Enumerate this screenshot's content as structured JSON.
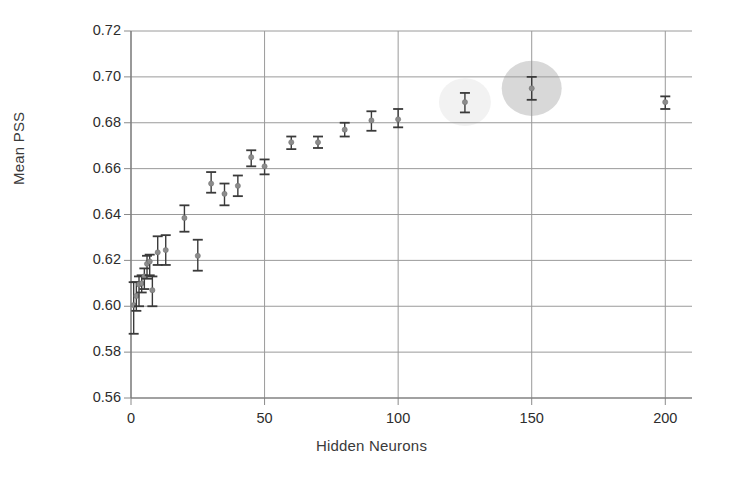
{
  "chart_data": {
    "type": "scatter",
    "title": "",
    "xlabel": "Hidden Neurons",
    "ylabel": "Mean PSS",
    "xlim": [
      0,
      210
    ],
    "ylim": [
      0.56,
      0.72
    ],
    "xticks": [
      0,
      50,
      100,
      150,
      200
    ],
    "xtick_labels": [
      "0",
      "50",
      "100",
      "150",
      "200"
    ],
    "yticks": [
      0.56,
      0.58,
      0.6,
      0.62,
      0.64,
      0.66,
      0.68,
      0.7,
      0.72
    ],
    "ytick_labels": [
      "0.56",
      "0.58",
      "0.60",
      "0.62",
      "0.64",
      "0.66",
      "0.68",
      "0.70",
      "0.72"
    ],
    "grid": true,
    "grid_axis": "both",
    "legend": false,
    "error_bars": "vertical",
    "marker": "circle",
    "marker_color": "#8c8c8c",
    "errorbar_color": "#3a3a3a",
    "series": [
      {
        "name": "Mean PSS vs Hidden Neurons",
        "points": [
          {
            "x": 1,
            "y": 0.6005,
            "err_low": 0.0125,
            "err_high": 0.01
          },
          {
            "x": 2,
            "y": 0.6045,
            "err_low": 0.0065,
            "err_high": 0.006
          },
          {
            "x": 3,
            "y": 0.6095,
            "err_low": 0.0095,
            "err_high": 0.0035
          },
          {
            "x": 4,
            "y": 0.61,
            "err_low": 0.004,
            "err_high": 0.0035
          },
          {
            "x": 5,
            "y": 0.613,
            "err_low": 0.0055,
            "err_high": 0.0035
          },
          {
            "x": 6,
            "y": 0.6185,
            "err_low": 0.0065,
            "err_high": 0.0035
          },
          {
            "x": 7,
            "y": 0.6195,
            "err_low": 0.006,
            "err_high": 0.003
          },
          {
            "x": 8,
            "y": 0.607,
            "err_low": 0.007,
            "err_high": 0.006
          },
          {
            "x": 10,
            "y": 0.6235,
            "err_low": 0.0055,
            "err_high": 0.007
          },
          {
            "x": 13,
            "y": 0.6245,
            "err_low": 0.0065,
            "err_high": 0.0065
          },
          {
            "x": 20,
            "y": 0.6385,
            "err_low": 0.006,
            "err_high": 0.0055
          },
          {
            "x": 25,
            "y": 0.622,
            "err_low": 0.0065,
            "err_high": 0.007
          },
          {
            "x": 30,
            "y": 0.6535,
            "err_low": 0.004,
            "err_high": 0.005
          },
          {
            "x": 35,
            "y": 0.649,
            "err_low": 0.005,
            "err_high": 0.0045
          },
          {
            "x": 40,
            "y": 0.6525,
            "err_low": 0.0045,
            "err_high": 0.0045
          },
          {
            "x": 45,
            "y": 0.665,
            "err_low": 0.004,
            "err_high": 0.003
          },
          {
            "x": 50,
            "y": 0.661,
            "err_low": 0.0035,
            "err_high": 0.003
          },
          {
            "x": 60,
            "y": 0.6715,
            "err_low": 0.003,
            "err_high": 0.0025
          },
          {
            "x": 70,
            "y": 0.6715,
            "err_low": 0.0025,
            "err_high": 0.0025
          },
          {
            "x": 80,
            "y": 0.677,
            "err_low": 0.003,
            "err_high": 0.003
          },
          {
            "x": 90,
            "y": 0.681,
            "err_low": 0.0045,
            "err_high": 0.004
          },
          {
            "x": 100,
            "y": 0.6815,
            "err_low": 0.0035,
            "err_high": 0.0045
          },
          {
            "x": 125,
            "y": 0.689,
            "err_low": 0.0045,
            "err_high": 0.004
          },
          {
            "x": 150,
            "y": 0.695,
            "err_low": 0.005,
            "err_high": 0.005
          },
          {
            "x": 200,
            "y": 0.689,
            "err_low": 0.003,
            "err_high": 0.0025
          }
        ]
      }
    ],
    "highlights": [
      {
        "x": 125,
        "y": 0.689,
        "radius_px": 26,
        "color": "#f0f0f0",
        "label": "faint-highlight-125"
      },
      {
        "x": 150,
        "y": 0.695,
        "radius_px": 30,
        "color": "#d4d4d4",
        "label": "strong-highlight-150"
      }
    ]
  }
}
